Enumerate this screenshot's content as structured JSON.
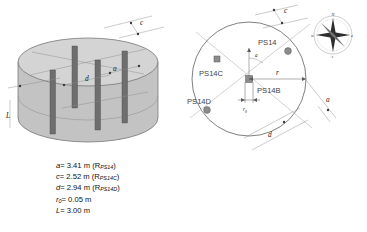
{
  "figure": {
    "background": "#ffffff"
  },
  "colors": {
    "cylinder_body": "#c9c9c9",
    "cylinder_top": "#d6d6d6",
    "rod": "#6e6e6e",
    "outline": "#6a6a6a",
    "dimension_line": "#8a8a8a",
    "marker": "#8c8c8c",
    "text": "#3f3f3f"
  },
  "cylinder_view": {
    "name": "3d-cylinder-view",
    "dimensions": [
      {
        "id": "a",
        "label": "a"
      },
      {
        "id": "c",
        "label": "c"
      },
      {
        "id": "d",
        "label": "d"
      },
      {
        "id": "L",
        "label": "L"
      }
    ],
    "rod_count": 4
  },
  "plan_view": {
    "name": "circular-plan-view",
    "wells": [
      {
        "id": "ps14",
        "label": "PS14"
      },
      {
        "id": "ps14b",
        "label": "PS14B"
      },
      {
        "id": "ps14c",
        "label": "PS14C"
      },
      {
        "id": "ps14d",
        "label": "PS14D"
      }
    ],
    "dimensions": [
      {
        "id": "c",
        "label": "c"
      },
      {
        "id": "r",
        "label": "r"
      },
      {
        "id": "r0",
        "label": "r",
        "sub": "0"
      },
      {
        "id": "a",
        "label": "a"
      },
      {
        "id": "d",
        "label": "d"
      },
      {
        "id": "angle",
        "label": "a"
      }
    ]
  },
  "compass": {
    "name": "compass-rose",
    "north": "N",
    "east": "e",
    "south": "s",
    "west": "w"
  },
  "legend": {
    "lines": [
      {
        "var": "a",
        "sub": "",
        "value": "= 3.41 m",
        "ref_pre": "(R",
        "ref_sub": "PS14",
        "ref_post": ")"
      },
      {
        "var": "c",
        "sub": "",
        "value": "= 2.52 m",
        "ref_pre": "(R",
        "ref_sub": "PS14C",
        "ref_post": ")"
      },
      {
        "var": "d",
        "sub": "",
        "value": "= 2.94 m",
        "ref_pre": "(R",
        "ref_sub": "PS14D",
        "ref_post": ")"
      },
      {
        "var": "r",
        "sub": "0",
        "value": "= 0.05 m",
        "ref_pre": "",
        "ref_sub": "",
        "ref_post": ""
      },
      {
        "var": "L",
        "sub": "",
        "value": "=  3.00 m",
        "ref_pre": "",
        "ref_sub": "",
        "ref_post": ""
      }
    ]
  }
}
